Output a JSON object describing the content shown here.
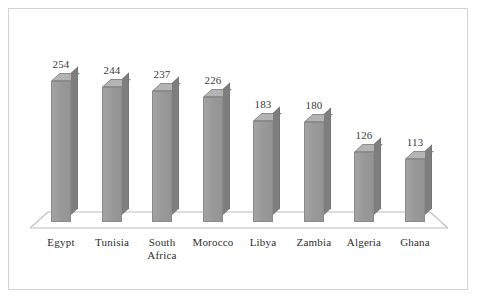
{
  "chart_data": {
    "type": "bar",
    "title": "",
    "subtitle": "",
    "xlabel": "",
    "ylabel": "",
    "categories": [
      "Egypt",
      "Tunisia",
      "South\nAfrica",
      "Morocco",
      "Libya",
      "Zambia",
      "Algeria",
      "Ghana"
    ],
    "values": [
      254,
      244,
      237,
      226,
      183,
      180,
      126,
      113
    ],
    "value_labels": [
      "254",
      "244",
      "237",
      "226",
      "183",
      "180",
      "126",
      "113"
    ],
    "ylim": [
      0,
      280
    ],
    "grid": false,
    "legend": false,
    "legend_position": "none",
    "style": "3d-column",
    "bar_color": "#9a9a9a",
    "bar_side_color": "#7e7e7e",
    "bar_top_color": "#b4b4b4",
    "axis_color": "#bdbdbd",
    "label_color": "#2e2e2e",
    "background": "#ffffff",
    "border_color": "#d2d2d2"
  }
}
